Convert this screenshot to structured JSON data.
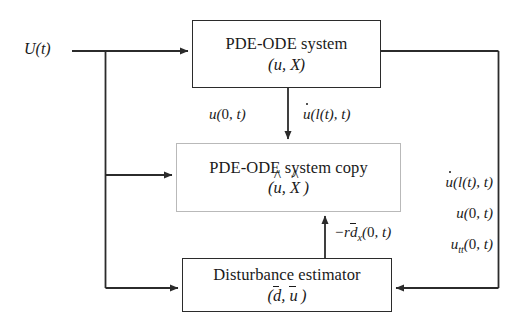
{
  "diagram": {
    "type": "block-diagram",
    "background_color": "#ffffff",
    "line_color": "#2b2b2b",
    "light_border_color": "#b9b9b9"
  },
  "input_signal": {
    "label": "U(t)"
  },
  "blocks": [
    {
      "id": "plant",
      "title": "PDE-ODE system",
      "subtitle": "(u, X)",
      "border": "heavy",
      "x": 192,
      "y": 20,
      "width": 189,
      "height": 68
    },
    {
      "id": "plant-copy",
      "title": "PDE-ODE system copy",
      "subtitle": "(û, X̂)",
      "border": "light",
      "x": 176,
      "y": 143,
      "width": 225,
      "height": 69
    },
    {
      "id": "disturbance-estimator",
      "title": "Disturbance estimator",
      "subtitle": "(d̄, ū)",
      "border": "heavy",
      "x": 182,
      "y": 258,
      "width": 210,
      "height": 54
    }
  ],
  "edge_labels": {
    "plant_to_copy_left": "u(0, t)",
    "plant_to_copy_right": "u̇(l(t), t)",
    "estimator_to_copy": "−rd̄x(0, t)",
    "feedback_column": [
      "u̇(l(t), t)",
      "u(0, t)",
      "utt(0, t)"
    ]
  },
  "connections": [
    {
      "from": "input",
      "to": "plant",
      "kind": "arrow"
    },
    {
      "from": "input-branch",
      "to": "plant-copy",
      "kind": "arrow"
    },
    {
      "from": "input-branch",
      "to": "disturbance-estimator",
      "kind": "arrow"
    },
    {
      "from": "plant",
      "to": "plant-copy",
      "kind": "arrow"
    },
    {
      "from": "disturbance-estimator",
      "to": "plant-copy",
      "kind": "arrow"
    },
    {
      "from": "plant",
      "to": "disturbance-estimator",
      "kind": "arrow"
    }
  ]
}
